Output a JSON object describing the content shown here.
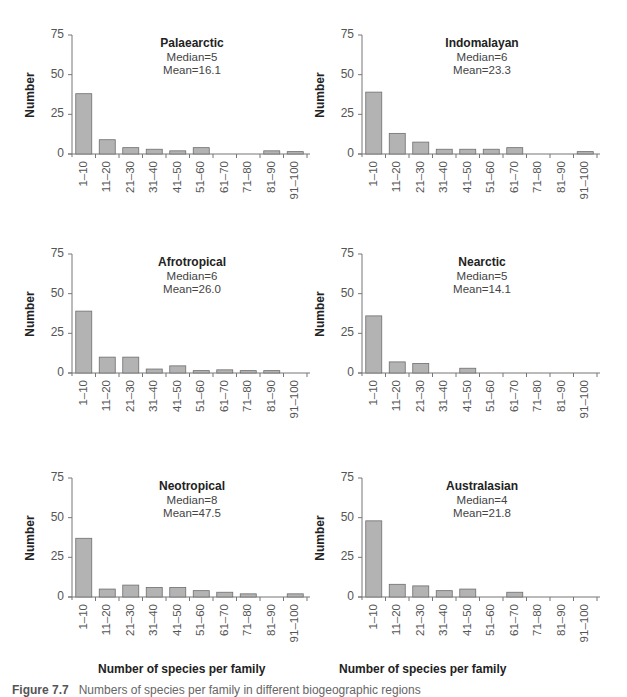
{
  "figure": {
    "caption_label": "Figure 7.7",
    "caption_text": "Numbers of species per family in different biogeographic regions"
  },
  "axes": {
    "ylabel": "Number",
    "xlabel": "Number of species per family",
    "yticks": [
      "0",
      "25",
      "50",
      "75"
    ],
    "categories": [
      "1–10",
      "11–20",
      "21–30",
      "31–40",
      "41–50",
      "51–60",
      "61–70",
      "71–80",
      "81–90",
      "91–100"
    ]
  },
  "colors": {
    "bar_fill": "#b3b3b3",
    "bar_stroke": "#6e6e6e",
    "axis": "#777777"
  },
  "panels": [
    {
      "title": "Palaearctic",
      "median": "Median=5",
      "mean": "Mean=16.1"
    },
    {
      "title": "Indomalayan",
      "median": "Median=6",
      "mean": "Mean=23.3"
    },
    {
      "title": "Afrotropical",
      "median": "Median=6",
      "mean": "Mean=26.0"
    },
    {
      "title": "Nearctic",
      "median": "Median=5",
      "mean": "Mean=14.1"
    },
    {
      "title": "Neotropical",
      "median": "Median=8",
      "mean": "Mean=47.5"
    },
    {
      "title": "Australasian",
      "median": "Median=4",
      "mean": "Mean=21.8"
    }
  ],
  "chart_data": [
    {
      "type": "bar",
      "title": "Palaearctic",
      "annotations": [
        "Median=5",
        "Mean=16.1"
      ],
      "categories": [
        "1–10",
        "11–20",
        "21–30",
        "31–40",
        "41–50",
        "51–60",
        "61–70",
        "71–80",
        "81–90",
        "91–100"
      ],
      "values": [
        38,
        9,
        4,
        3,
        2,
        4,
        0,
        0,
        2,
        1.5
      ],
      "xlabel": "",
      "ylabel": "Number",
      "ylim": [
        0,
        75
      ],
      "yticks": [
        0,
        25,
        50,
        75
      ],
      "grid": false
    },
    {
      "type": "bar",
      "title": "Indomalayan",
      "annotations": [
        "Median=6",
        "Mean=23.3"
      ],
      "categories": [
        "1–10",
        "11–20",
        "21–30",
        "31–40",
        "41–50",
        "51–60",
        "61–70",
        "71–80",
        "81–90",
        "91–100"
      ],
      "values": [
        39,
        13,
        7.5,
        3,
        3,
        3,
        4,
        0,
        0,
        1.5
      ],
      "xlabel": "",
      "ylabel": "Number",
      "ylim": [
        0,
        75
      ],
      "yticks": [
        0,
        25,
        50,
        75
      ],
      "grid": false
    },
    {
      "type": "bar",
      "title": "Afrotropical",
      "annotations": [
        "Median=6",
        "Mean=26.0"
      ],
      "categories": [
        "1–10",
        "11–20",
        "21–30",
        "31–40",
        "41–50",
        "51–60",
        "61–70",
        "71–80",
        "81–90",
        "91–100"
      ],
      "values": [
        39,
        10,
        10,
        2.5,
        4.5,
        1.5,
        2,
        1.5,
        1.5,
        0
      ],
      "xlabel": "",
      "ylabel": "Number",
      "ylim": [
        0,
        75
      ],
      "yticks": [
        0,
        25,
        50,
        75
      ],
      "grid": false
    },
    {
      "type": "bar",
      "title": "Nearctic",
      "annotations": [
        "Median=5",
        "Mean=14.1"
      ],
      "categories": [
        "1–10",
        "11–20",
        "21–30",
        "31–40",
        "41–50",
        "51–60",
        "61–70",
        "71–80",
        "81–90",
        "91–100"
      ],
      "values": [
        36,
        7,
        6,
        0,
        3,
        0,
        0,
        0,
        0,
        0
      ],
      "xlabel": "",
      "ylabel": "Number",
      "ylim": [
        0,
        75
      ],
      "yticks": [
        0,
        25,
        50,
        75
      ],
      "grid": false
    },
    {
      "type": "bar",
      "title": "Neotropical",
      "annotations": [
        "Median=8",
        "Mean=47.5"
      ],
      "categories": [
        "1–10",
        "11–20",
        "21–30",
        "31–40",
        "41–50",
        "51–60",
        "61–70",
        "71–80",
        "81–90",
        "91–100"
      ],
      "values": [
        37,
        5,
        7.5,
        6,
        6,
        4,
        3,
        2,
        0,
        2
      ],
      "xlabel": "Number of species per family",
      "ylabel": "Number",
      "ylim": [
        0,
        75
      ],
      "yticks": [
        0,
        25,
        50,
        75
      ],
      "grid": false
    },
    {
      "type": "bar",
      "title": "Australasian",
      "annotations": [
        "Median=4",
        "Mean=21.8"
      ],
      "categories": [
        "1–10",
        "11–20",
        "21–30",
        "31–40",
        "41–50",
        "51–60",
        "61–70",
        "71–80",
        "81–90",
        "91–100"
      ],
      "values": [
        48,
        8,
        7,
        4,
        5,
        0,
        3,
        0,
        0,
        0
      ],
      "xlabel": "Number of species per family",
      "ylabel": "Number",
      "ylim": [
        0,
        75
      ],
      "yticks": [
        0,
        25,
        50,
        75
      ],
      "grid": false
    }
  ]
}
